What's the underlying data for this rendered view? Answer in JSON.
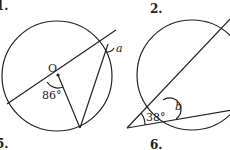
{
  "figures": [
    {
      "number_label": "1.",
      "center_label": "O",
      "given_angle": "86°",
      "unknown_angle": "a"
    },
    {
      "number_label": "2.",
      "given_angle": "38°",
      "unknown_angle": "b"
    }
  ],
  "next_row_labels": [
    "5.",
    "6."
  ]
}
